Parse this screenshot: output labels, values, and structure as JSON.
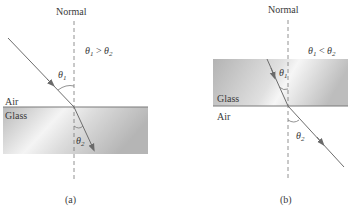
{
  "panels": [
    {
      "id": "a",
      "caption": "(a)",
      "normal_label": "Normal",
      "relation": {
        "left": "θ",
        "left_sub": "1",
        "op": " > ",
        "right": "θ",
        "right_sub": "2"
      },
      "upper_medium": "Air",
      "lower_medium": "Glass",
      "angle1": {
        "sym": "θ",
        "sub": "1"
      },
      "angle2": {
        "sym": "θ",
        "sub": "2"
      }
    },
    {
      "id": "b",
      "caption": "(b)",
      "normal_label": "Normal",
      "relation": {
        "left": "θ",
        "left_sub": "1",
        "op": " < ",
        "right": "θ",
        "right_sub": "2"
      },
      "upper_medium": "Glass",
      "lower_medium": "Air",
      "angle1": {
        "sym": "θ",
        "sub": "1"
      },
      "angle2": {
        "sym": "θ",
        "sub": "2"
      }
    }
  ],
  "colors": {
    "glass_dark": "#bdbdbd",
    "glass_light": "#f2f2f2",
    "interface": "#7a7a7a",
    "ray": "#6d6d6d",
    "normal": "#777777"
  }
}
